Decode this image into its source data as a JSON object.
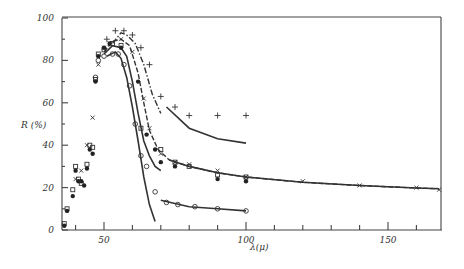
{
  "chart_data": {
    "type": "scatter",
    "title": "",
    "xlabel": "λ(μ)",
    "ylabel": "R (%)",
    "xlim": [
      35,
      168
    ],
    "ylim": [
      0,
      100
    ],
    "x_ticks": [
      50,
      100,
      150
    ],
    "y_ticks": [
      0,
      20,
      40,
      60,
      80,
      100
    ],
    "grid": false,
    "legend": null,
    "series": [
      {
        "name": "plus-markers (dash-dot + solid curve)",
        "marker": "+",
        "points": [
          [
            51,
            90
          ],
          [
            54,
            94
          ],
          [
            57,
            94
          ],
          [
            60,
            92
          ],
          [
            63,
            86
          ],
          [
            66,
            78
          ],
          [
            70,
            63
          ],
          [
            75,
            58
          ],
          [
            80,
            54
          ],
          [
            90,
            54
          ],
          [
            100,
            54
          ]
        ],
        "curve": [
          [
            53,
            88
          ],
          [
            56,
            93
          ],
          [
            58,
            92
          ],
          [
            61,
            88
          ],
          [
            64,
            78
          ],
          [
            67,
            64
          ],
          [
            70,
            55
          ]
        ],
        "curve_tail": [
          [
            72,
            58
          ],
          [
            80,
            48
          ],
          [
            90,
            43
          ],
          [
            100,
            41
          ]
        ]
      },
      {
        "name": "cross-markers (dashed curve, long tail)",
        "marker": "x",
        "points": [
          [
            40,
            24
          ],
          [
            42,
            28
          ],
          [
            44,
            40
          ],
          [
            46,
            53
          ],
          [
            48,
            78
          ],
          [
            50,
            86
          ],
          [
            52,
            88
          ],
          [
            56,
            90
          ],
          [
            60,
            84
          ],
          [
            64,
            62
          ],
          [
            66,
            48
          ],
          [
            70,
            36
          ],
          [
            75,
            32
          ],
          [
            80,
            31
          ],
          [
            90,
            28
          ],
          [
            100,
            25
          ],
          [
            120,
            23
          ],
          [
            140,
            21
          ],
          [
            160,
            20
          ],
          [
            168,
            19
          ]
        ],
        "curve": [
          [
            50,
            84
          ],
          [
            53,
            89
          ],
          [
            56,
            90
          ],
          [
            59,
            87
          ],
          [
            62,
            74
          ],
          [
            64,
            60
          ],
          [
            66,
            47
          ],
          [
            69,
            38
          ],
          [
            73,
            33
          ],
          [
            80,
            30
          ],
          [
            90,
            27
          ],
          [
            100,
            25
          ],
          [
            120,
            22.5
          ],
          [
            140,
            21
          ],
          [
            160,
            19.8
          ],
          [
            168,
            19.5
          ]
        ]
      },
      {
        "name": "square-markers",
        "marker": "square",
        "points": [
          [
            36,
            3
          ],
          [
            37,
            10
          ],
          [
            39,
            19
          ],
          [
            40,
            30
          ],
          [
            41,
            24
          ],
          [
            42,
            22
          ],
          [
            44,
            31
          ],
          [
            45,
            40
          ],
          [
            46,
            39
          ],
          [
            47,
            71
          ],
          [
            48,
            83
          ],
          [
            50,
            85
          ],
          [
            53,
            88
          ],
          [
            56,
            87
          ],
          [
            63,
            48
          ],
          [
            70,
            38
          ],
          [
            75,
            32
          ],
          [
            80,
            30
          ],
          [
            90,
            26
          ],
          [
            100,
            25
          ]
        ]
      },
      {
        "name": "filled-circle-markers (solid curve)",
        "marker": "filled-circle",
        "points": [
          [
            36,
            2
          ],
          [
            37,
            9
          ],
          [
            39,
            16
          ],
          [
            40,
            28
          ],
          [
            41,
            23
          ],
          [
            42,
            23
          ],
          [
            43,
            21
          ],
          [
            44,
            29
          ],
          [
            45,
            38
          ],
          [
            46,
            36
          ],
          [
            47,
            70
          ],
          [
            48,
            82
          ],
          [
            50,
            86
          ],
          [
            52,
            88
          ],
          [
            56,
            86
          ],
          [
            62,
            70
          ],
          [
            65,
            45
          ],
          [
            68,
            38
          ],
          [
            70,
            32
          ],
          [
            75,
            30
          ],
          [
            90,
            24
          ],
          [
            100,
            23
          ]
        ],
        "curve": [
          [
            50,
            83
          ],
          [
            53,
            87
          ],
          [
            56,
            86
          ],
          [
            58,
            82
          ],
          [
            60,
            70
          ],
          [
            62,
            55
          ],
          [
            64,
            42
          ],
          [
            66,
            35
          ],
          [
            68,
            30
          ],
          [
            70,
            28
          ]
        ]
      },
      {
        "name": "open-circle-markers (solid curve + low tail)",
        "marker": "open-circle",
        "points": [
          [
            47,
            72
          ],
          [
            48,
            80
          ],
          [
            50,
            82
          ],
          [
            53,
            83
          ],
          [
            55,
            83
          ],
          [
            57,
            78
          ],
          [
            59,
            68
          ],
          [
            61,
            50
          ],
          [
            63,
            35
          ],
          [
            65,
            30
          ],
          [
            68,
            18
          ],
          [
            72,
            13
          ],
          [
            76,
            12
          ],
          [
            82,
            11
          ],
          [
            90,
            10
          ],
          [
            100,
            9
          ]
        ],
        "curve": [
          [
            51,
            82
          ],
          [
            54,
            84
          ],
          [
            56,
            81
          ],
          [
            58,
            72
          ],
          [
            60,
            58
          ],
          [
            62,
            42
          ],
          [
            64,
            25
          ],
          [
            66,
            12
          ],
          [
            68,
            4
          ]
        ],
        "curve_tail": [
          [
            70,
            14
          ],
          [
            80,
            11
          ],
          [
            90,
            10
          ],
          [
            100,
            9
          ]
        ]
      }
    ]
  },
  "axes": {
    "xlabel": "λ(μ)",
    "ylabel": "R (%)",
    "x_tick_labels": [
      "50",
      "100",
      "150"
    ],
    "y_tick_labels": [
      "0",
      "20",
      "40",
      "60",
      "80",
      "100"
    ]
  }
}
